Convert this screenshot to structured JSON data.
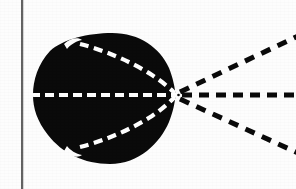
{
  "figure": {
    "canvas": {
      "width": 296,
      "height": 189
    },
    "colors": {
      "background": "#fdfdfd",
      "ink": "#0a0a0a",
      "dash_light": "#ffffff",
      "margin_rule": "#2b2b2b"
    },
    "margin_rule": {
      "name": "vertical-rule",
      "x": 22,
      "y_start": 0,
      "y_end": 189,
      "width": 1.6
    },
    "blob": {
      "name": "filled-region",
      "fill": "#0a0a0a",
      "left_x": 33,
      "right_tip_x": 175,
      "top_y": 33,
      "bottom_y": 164,
      "center_y": 95,
      "notch_top": {
        "x": 72,
        "y": 41
      },
      "notch_bottom": {
        "x": 72,
        "y": 150
      }
    },
    "dashes": {
      "light_dash": 9,
      "light_gap": 5,
      "light_thickness": 4.2,
      "dark_dash": 9,
      "dark_gap": 6,
      "dark_thickness": 5.0
    },
    "curves": [
      {
        "name": "axis-dashed-line",
        "style": "white-dashed",
        "from": {
          "x": 32,
          "y": 95
        },
        "to": {
          "x": 175,
          "y": 95
        }
      },
      {
        "name": "upper-characteristic-curve",
        "style": "white-dashed",
        "from": {
          "x": 83,
          "y": 45
        },
        "to": {
          "x": 175,
          "y": 95
        }
      },
      {
        "name": "lower-characteristic-curve",
        "style": "white-dashed",
        "from": {
          "x": 83,
          "y": 146
        },
        "to": {
          "x": 175,
          "y": 95
        }
      },
      {
        "name": "axis-ray-right",
        "style": "black-dashed",
        "from": {
          "x": 178,
          "y": 95
        },
        "to": {
          "x": 296,
          "y": 95
        }
      },
      {
        "name": "upper-ray-right",
        "style": "black-dashed",
        "from": {
          "x": 178,
          "y": 92
        },
        "to": {
          "x": 296,
          "y": 37
        }
      },
      {
        "name": "lower-ray-right",
        "style": "black-dashed",
        "from": {
          "x": 178,
          "y": 99
        },
        "to": {
          "x": 296,
          "y": 151
        }
      }
    ],
    "vertex": {
      "name": "cusp-point",
      "x": 175,
      "y": 95
    }
  }
}
